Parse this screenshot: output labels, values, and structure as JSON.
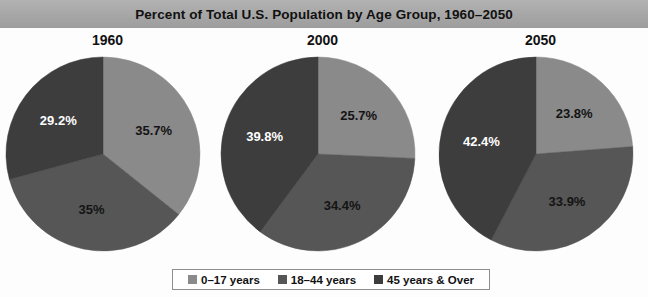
{
  "title": "Percent of Total U.S. Population by Age Group, 1960–2050",
  "legend": {
    "items": [
      {
        "label": "0–17 years",
        "color": "#8a8a8a",
        "swatch_icon": "square-swatch-icon"
      },
      {
        "label": "18–44 years",
        "color": "#565656",
        "swatch_icon": "square-swatch-icon"
      },
      {
        "label": "45 years & Over",
        "color": "#3d3d3d",
        "swatch_icon": "square-swatch-icon"
      }
    ]
  },
  "panels": [
    {
      "title": "1960",
      "labels": [
        "35.7%",
        "35%",
        "29.2%"
      ]
    },
    {
      "title": "2000",
      "labels": [
        "25.7%",
        "34.4%",
        "39.8%"
      ]
    },
    {
      "title": "2050",
      "labels": [
        "23.8%",
        "33.9%",
        "42.4%"
      ]
    }
  ],
  "chart_data": {
    "type": "pie",
    "title": "Percent of Total U.S. Population by Age Group, 1960–2050",
    "legend_position": "bottom",
    "categories": [
      "0–17 years",
      "18–44 years",
      "45 years & Over"
    ],
    "colors": [
      "#8a8a8a",
      "#565656",
      "#3d3d3d"
    ],
    "unit": "percent",
    "start_angle_deg": 0,
    "direction": "clockwise",
    "charts": [
      {
        "title": "1960",
        "values": [
          35.7,
          35.0,
          29.2
        ],
        "labels": [
          "35.7%",
          "35%",
          "29.2%"
        ]
      },
      {
        "title": "2000",
        "values": [
          25.7,
          34.4,
          39.8
        ],
        "labels": [
          "25.7%",
          "34.4%",
          "39.8%"
        ]
      },
      {
        "title": "2050",
        "values": [
          23.8,
          33.9,
          42.4
        ],
        "labels": [
          "23.8%",
          "33.9%",
          "42.4%"
        ]
      }
    ]
  }
}
